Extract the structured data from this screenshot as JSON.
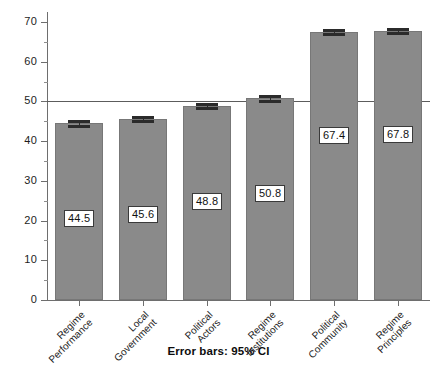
{
  "chart_data": {
    "type": "bar",
    "title": "",
    "subtitle": "",
    "xlabel": "",
    "ylabel": "",
    "categories": [
      "Regime Performance",
      "Local Government",
      "Political Actors",
      "Regime Institutions",
      "Political Community",
      "Regime Principles"
    ],
    "category_lines": [
      [
        "Regime",
        "Performance"
      ],
      [
        "Local",
        "Government"
      ],
      [
        "Political",
        "Actors"
      ],
      [
        "Regime",
        "Institutions"
      ],
      [
        "Political",
        "Community"
      ],
      [
        "Regime",
        "Principles"
      ]
    ],
    "values": [
      44.5,
      45.6,
      48.8,
      50.8,
      67.4,
      67.8
    ],
    "value_labels": [
      "44.5",
      "45.6",
      "48.8",
      "50.8",
      "67.4",
      "67.8"
    ],
    "error_ci_low": [
      43.9,
      45.0,
      48.3,
      50.2,
      66.9,
      67.3
    ],
    "error_ci_high": [
      45.1,
      46.2,
      49.3,
      51.4,
      67.9,
      68.3
    ],
    "error_note": "Error bars: 95% CI",
    "ylim": [
      0,
      72
    ],
    "yticks": [
      0,
      10,
      20,
      30,
      40,
      50,
      60,
      70
    ],
    "ytick_labels": [
      "0",
      "10",
      "20",
      "30",
      "40",
      "50",
      "60",
      "70"
    ],
    "yticks_minor": [
      5,
      15,
      25,
      35,
      45,
      55,
      65
    ],
    "reference_line": 50,
    "grid": false,
    "legend": "none",
    "bar_color": "#8a8a8a",
    "bar_edge_color": "#777777",
    "error_bar_color": "#2b2b2b",
    "reference_line_color": "#5c5c5c",
    "axis_color": "#6e6e6e"
  }
}
